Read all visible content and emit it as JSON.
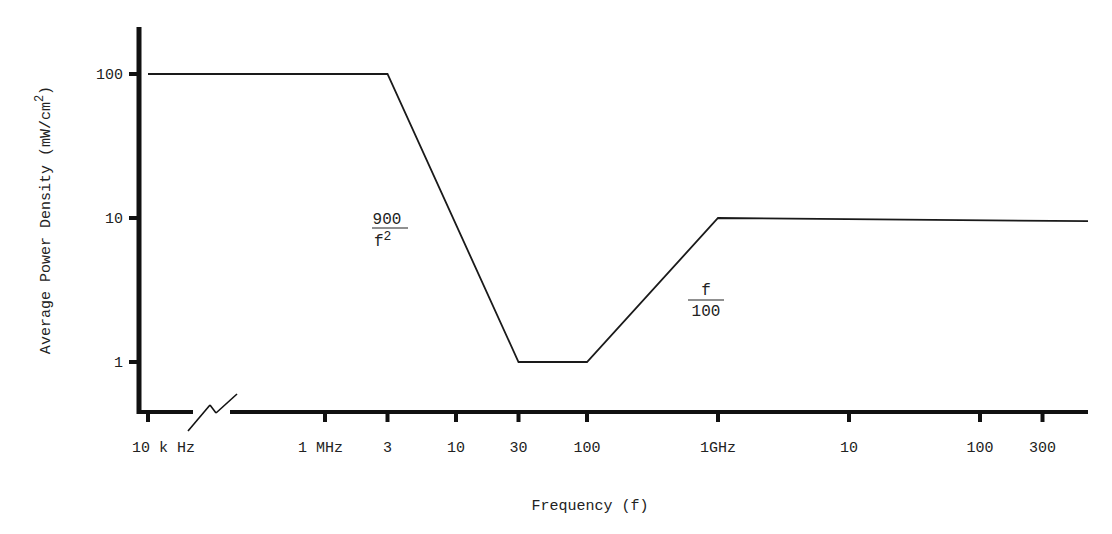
{
  "chart_data": {
    "type": "line",
    "title": "",
    "xlabel": "Frequency (f)",
    "ylabel": "Average Power Density (mW/cm",
    "ylabel_superscript": "2",
    "ylabel_close": ")",
    "xscale": "log",
    "yscale": "log",
    "ylim": [
      0.5,
      200
    ],
    "grid": false,
    "axis_break": "between 10 kHz and 1 MHz",
    "x_ticks": [
      {
        "label": "10 k Hz",
        "value_hz": 10000
      },
      {
        "label": "1 MHz",
        "value_hz": 1000000
      },
      {
        "label": "3",
        "value_hz": 3000000
      },
      {
        "label": "10",
        "value_hz": 10000000
      },
      {
        "label": "30",
        "value_hz": 30000000
      },
      {
        "label": "100",
        "value_hz": 100000000
      },
      {
        "label": "1GHz",
        "value_hz": 1000000000
      },
      {
        "label": "10",
        "value_hz": 10000000000
      },
      {
        "label": "100",
        "value_hz": 100000000000
      },
      {
        "label": "300",
        "value_hz": 300000000000
      }
    ],
    "y_ticks": [
      {
        "label": "100",
        "value": 100
      },
      {
        "label": "10",
        "value": 10
      },
      {
        "label": "1",
        "value": 1
      }
    ],
    "series": [
      {
        "name": "Power density limit",
        "points": [
          {
            "x_hz": 10000,
            "y": 100
          },
          {
            "x_hz": 3000000,
            "y": 100
          },
          {
            "x_hz": 30000000,
            "y": 1
          },
          {
            "x_hz": 100000000,
            "y": 1
          },
          {
            "x_hz": 1000000000,
            "y": 10
          },
          {
            "x_hz": 300000000000,
            "y": 9.5
          }
        ]
      }
    ],
    "annotations": [
      {
        "numerator": "900",
        "denominator": "f",
        "denominator_superscript": "2",
        "near_segment": "3 MHz - 30 MHz"
      },
      {
        "numerator": "f",
        "denominator": "100",
        "near_segment": "100 MHz - 1 GHz"
      }
    ]
  }
}
